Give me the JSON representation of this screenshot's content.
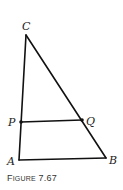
{
  "figure": {
    "caption_prefix": "F",
    "caption_smallcaps": "IGURE",
    "caption_number": "7.67",
    "line_color": "#111111",
    "label_color": "#222222"
  },
  "points": {
    "C": {
      "label": "C",
      "x": 26,
      "y": 35
    },
    "A": {
      "label": "A",
      "x": 19,
      "y": 160
    },
    "B": {
      "label": "B",
      "x": 106,
      "y": 158
    },
    "P": {
      "label": "P",
      "x": 21,
      "y": 122
    },
    "Q": {
      "label": "Q",
      "x": 82,
      "y": 120
    }
  },
  "segments": [
    {
      "from": "C",
      "to": "A"
    },
    {
      "from": "C",
      "to": "B"
    },
    {
      "from": "A",
      "to": "B"
    },
    {
      "from": "P",
      "to": "Q"
    }
  ],
  "marked_points": [
    "P",
    "Q"
  ]
}
